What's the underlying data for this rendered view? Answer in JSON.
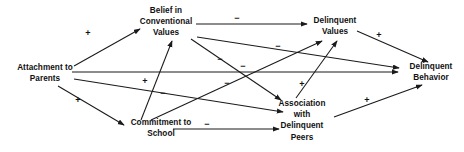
{
  "diagram": {
    "type": "path-diagram",
    "width": 464,
    "height": 152,
    "background": "#ffffff",
    "line_color": "#1a1a1a",
    "text_color": "#111111",
    "nodes": [
      {
        "id": "attachment",
        "label": "Attachment to\nParents",
        "x": 45,
        "y": 73,
        "w": 84,
        "h": 24
      },
      {
        "id": "belief",
        "label": "Belief in\nConventional\nValues",
        "x": 166,
        "y": 22,
        "w": 74,
        "h": 36
      },
      {
        "id": "delvalues",
        "label": "Delinquent\nValues",
        "x": 335,
        "y": 26,
        "w": 62,
        "h": 24
      },
      {
        "id": "delbehav",
        "label": "Delinquent\nBehavior",
        "x": 431,
        "y": 72,
        "w": 62,
        "h": 24
      },
      {
        "id": "commitment",
        "label": "Commitment to\nSchool",
        "x": 161,
        "y": 128,
        "w": 84,
        "h": 24
      },
      {
        "id": "peers",
        "label": "Association\nwith\nDelinquent\nPeers",
        "x": 302,
        "y": 121,
        "w": 66,
        "h": 48
      }
    ],
    "edges": [
      {
        "id": "attachment-belief",
        "from": "attachment",
        "to": "belief",
        "sign": "+",
        "sign_x": 88,
        "sign_y": 33
      },
      {
        "id": "attachment-commitment",
        "from": "attachment",
        "to": "commitment",
        "sign": "+",
        "sign_x": 78,
        "sign_y": 100
      },
      {
        "id": "attachment-delbehav",
        "from": "attachment",
        "to": "delbehav",
        "sign": "−",
        "sign_x": 243,
        "sign_y": 66
      },
      {
        "id": "attachment-peers",
        "from": "attachment",
        "to": "peers",
        "sign": "−",
        "sign_x": 163,
        "sign_y": 93
      },
      {
        "id": "belief-delvalues",
        "from": "belief",
        "to": "delvalues",
        "sign": "−",
        "sign_x": 237,
        "sign_y": 18
      },
      {
        "id": "belief-peers",
        "from": "belief",
        "to": "peers",
        "sign": "−",
        "sign_x": 220,
        "sign_y": 59
      },
      {
        "id": "commitment-belief",
        "from": "commitment",
        "to": "belief",
        "sign": "+",
        "sign_x": 145,
        "sign_y": 81
      },
      {
        "id": "commitment-delvalues",
        "from": "commitment",
        "to": "delvalues",
        "sign": "−",
        "sign_x": 227,
        "sign_y": 83
      },
      {
        "id": "commitment-peers",
        "from": "commitment",
        "to": "peers",
        "sign": "−",
        "sign_x": 207,
        "sign_y": 124
      },
      {
        "id": "delvalues-delbehav",
        "from": "delvalues",
        "to": "delbehav",
        "sign": "+",
        "sign_x": 379,
        "sign_y": 35
      },
      {
        "id": "peers-delvalues",
        "from": "peers",
        "to": "delvalues",
        "sign": "+",
        "sign_x": 302,
        "sign_y": 84
      },
      {
        "id": "peers-delbehav",
        "from": "peers",
        "to": "delbehav",
        "sign": "+",
        "sign_x": 367,
        "sign_y": 100
      },
      {
        "id": "belief-delbehav",
        "from": "belief",
        "to": "delbehav",
        "sign": "−",
        "sign_x": 278,
        "sign_y": 46
      }
    ],
    "signs": {
      "positive": "+",
      "negative": "−"
    }
  }
}
